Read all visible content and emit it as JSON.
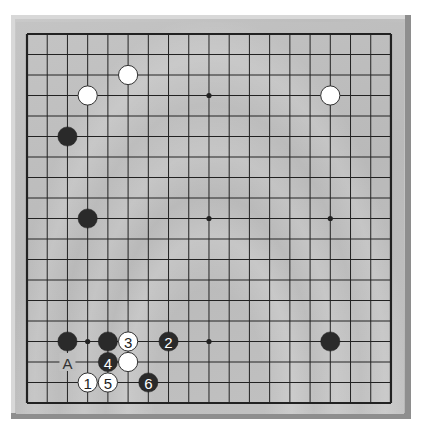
{
  "board": {
    "size": 19,
    "origin_x": 27,
    "origin_y": 34,
    "step_x": 20.22,
    "step_y": 20.5,
    "colors": {
      "line": "#222222",
      "black_stone": "#2a2a2a",
      "white_stone": "#ffffff",
      "white_outline": "#333333"
    },
    "star_points": [
      [
        3,
        3
      ],
      [
        9,
        3
      ],
      [
        15,
        3
      ],
      [
        3,
        9
      ],
      [
        9,
        9
      ],
      [
        15,
        9
      ],
      [
        3,
        15
      ],
      [
        9,
        15
      ],
      [
        15,
        15
      ]
    ]
  },
  "stones": [
    {
      "color": "white",
      "col": 5,
      "row": 2,
      "label": ""
    },
    {
      "color": "white",
      "col": 3,
      "row": 3,
      "label": ""
    },
    {
      "color": "white",
      "col": 15,
      "row": 3,
      "label": ""
    },
    {
      "color": "black",
      "col": 2,
      "row": 5,
      "label": ""
    },
    {
      "color": "black",
      "col": 3,
      "row": 9,
      "label": ""
    },
    {
      "color": "black",
      "col": 2,
      "row": 15,
      "label": ""
    },
    {
      "color": "black",
      "col": 4,
      "row": 15,
      "label": ""
    },
    {
      "color": "white",
      "col": 5,
      "row": 15,
      "label": "3"
    },
    {
      "color": "black",
      "col": 7,
      "row": 15,
      "label": "2"
    },
    {
      "color": "black",
      "col": 15,
      "row": 15,
      "label": ""
    },
    {
      "color": "black",
      "col": 4,
      "row": 16,
      "label": "4"
    },
    {
      "color": "white",
      "col": 5,
      "row": 16,
      "label": ""
    },
    {
      "color": "white",
      "col": 3,
      "row": 17,
      "label": "1"
    },
    {
      "color": "white",
      "col": 4,
      "row": 17,
      "label": "5"
    },
    {
      "color": "black",
      "col": 6,
      "row": 17,
      "label": "6"
    }
  ],
  "markers": [
    {
      "col": 2,
      "row": 16,
      "label": "A"
    }
  ]
}
